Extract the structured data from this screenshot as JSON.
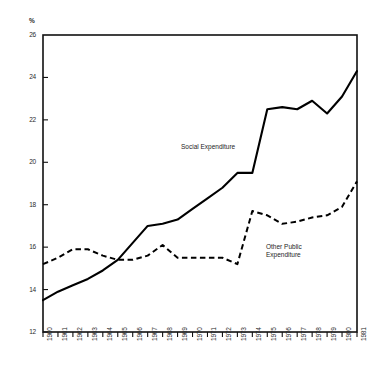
{
  "figure": {
    "top_note": "",
    "unit_label": "%",
    "annotations": [
      {
        "name": "social-expenditure",
        "text": "Social Expenditure",
        "x": 181,
        "y": 143
      },
      {
        "name": "other-public-expenditure",
        "line1": "Other Public",
        "line2": "Expenditure",
        "x": 266,
        "y": 243
      }
    ]
  },
  "chart_data": {
    "type": "line",
    "title": "",
    "xlabel": "",
    "ylabel": "%",
    "ylim": [
      12,
      26
    ],
    "yticks": [
      12,
      14,
      16,
      18,
      20,
      22,
      24,
      26
    ],
    "grid": false,
    "legend_position": "inline-annotation",
    "categories": [
      "1960",
      "1961",
      "1962",
      "1963",
      "1964",
      "1965",
      "1966",
      "1967",
      "1968",
      "1969",
      "1970",
      "1971",
      "1972",
      "1973",
      "1974",
      "1975",
      "1976",
      "1977",
      "1978",
      "1979",
      "1980",
      "1981"
    ],
    "series": [
      {
        "name": "Social Expenditure",
        "style": "solid",
        "values": [
          13.5,
          13.9,
          14.2,
          14.5,
          14.9,
          15.4,
          16.2,
          17.0,
          17.1,
          17.3,
          17.8,
          18.3,
          18.8,
          19.5,
          19.5,
          22.5,
          22.6,
          22.5,
          22.9,
          22.3,
          23.1,
          24.3
        ]
      },
      {
        "name": "Other Public Expenditure",
        "style": "dashed",
        "values": [
          15.2,
          15.5,
          15.9,
          15.9,
          15.6,
          15.4,
          15.4,
          15.6,
          16.1,
          15.5,
          15.5,
          15.5,
          15.5,
          15.2,
          17.7,
          17.5,
          17.1,
          17.2,
          17.4,
          17.5,
          17.9,
          19.1
        ]
      }
    ]
  },
  "axes_geometry": {
    "plot_left": 43,
    "plot_right": 357,
    "plot_top": 35,
    "plot_bottom": 332
  }
}
